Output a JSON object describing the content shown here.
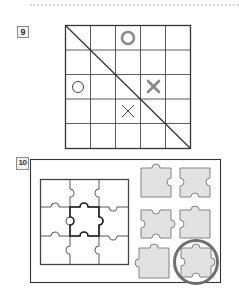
{
  "questions": [
    {
      "number": "9",
      "type": "tic-tac-toe-grid",
      "grid": {
        "rows": 5,
        "cols": 5,
        "diagonal": "top-left-to-bottom-right"
      },
      "marks": [
        {
          "symbol": "O",
          "row": 0,
          "col": 2,
          "style": "bold-gray"
        },
        {
          "symbol": "O",
          "row": 2,
          "col": 0,
          "style": "thin-dark"
        },
        {
          "symbol": "X",
          "row": 2,
          "col": 3,
          "style": "bold-gray"
        },
        {
          "symbol": "X",
          "row": 3,
          "col": 2,
          "style": "thin-dark"
        }
      ]
    },
    {
      "number": "10",
      "type": "jigsaw-puzzle-match",
      "puzzle": {
        "rows": 3,
        "cols": 3,
        "highlighted_piece": "center"
      },
      "options_count": 6,
      "selected_option": 6
    }
  ],
  "colors": {
    "line": "#333333",
    "mark_bold": "#8a8a8a",
    "mark_thin": "#444444",
    "piece_fill": "#e2e2e2",
    "piece_stroke": "#777777",
    "circle": "#6e6e6e"
  }
}
